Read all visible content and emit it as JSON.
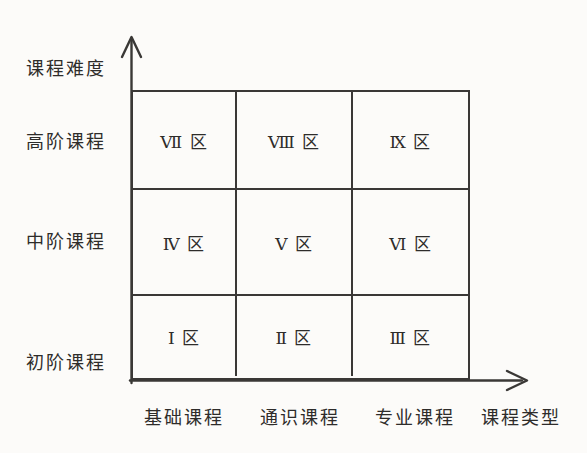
{
  "diagram": {
    "y_axis_label": "课程难度",
    "x_axis_label": "课程类型",
    "row_labels": [
      "高阶课程",
      "中阶课程",
      "初阶课程"
    ],
    "col_labels": [
      "基础课程",
      "通识课程",
      "专业课程"
    ],
    "cells": [
      [
        "Ⅶ 区",
        "Ⅷ 区",
        "Ⅸ 区"
      ],
      [
        "Ⅳ 区",
        "Ⅴ 区",
        "Ⅵ 区"
      ],
      [
        "Ⅰ 区",
        "Ⅱ 区",
        "Ⅲ 区"
      ]
    ],
    "colors": {
      "line": "#3a3836",
      "background": "#fcfbf9",
      "text": "#2e2c2a"
    }
  }
}
